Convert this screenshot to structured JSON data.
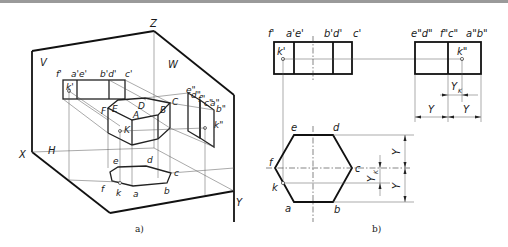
{
  "figure_a": {
    "caption": "a)",
    "planes": {
      "V": "V",
      "W": "W",
      "H": "H"
    },
    "axes": {
      "X": "X",
      "Y": "Y",
      "Z": "Z"
    },
    "front_projection_labels": [
      "f'",
      "a'e'",
      "b'd'",
      "c'"
    ],
    "front_point": "k'",
    "side_projection_labels": [
      "e\"",
      "d\"",
      "f\"",
      "c\"",
      "a\"",
      "b\""
    ],
    "side_point": "k\"",
    "solid_vertices": [
      "F",
      "E",
      "D",
      "A",
      "B",
      "C"
    ],
    "solid_point": "K",
    "top_projection_labels": [
      "e",
      "d",
      "c",
      "f",
      "k",
      "a",
      "b"
    ]
  },
  "figure_b": {
    "caption": "b)",
    "front_view_labels": [
      "f'",
      "a'e'",
      "b'd'",
      "c'"
    ],
    "front_point": "k'",
    "side_view_labels": [
      "e\"d\"",
      "f\"c\"",
      "a\"b\""
    ],
    "side_point": "k\"",
    "top_view_labels": {
      "e": "e",
      "d": "d",
      "f": "f",
      "c": "c",
      "k": "k",
      "a": "a",
      "b": "b"
    },
    "dimensions": {
      "Y": "Y",
      "Yk": "Y",
      "Yk_sub": "K"
    }
  }
}
